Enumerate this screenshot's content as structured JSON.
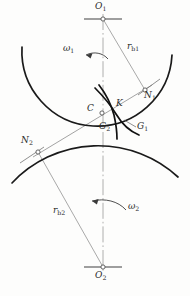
{
  "figure": {
    "colors": {
      "base_curve": "#1a1a1a",
      "involute_curve": "#111111",
      "thin_line": "#8c8c8c",
      "centerline": "#9a9a9a",
      "hatch": "#9e9e9e",
      "label": "#2b2b2b",
      "background": "#fdfdfc"
    }
  },
  "labels": {
    "o1": "O",
    "o1_sub": "1",
    "o2": "O",
    "o2_sub": "2",
    "n1": "N",
    "n1_sub": "1",
    "n2": "N",
    "n2_sub": "2",
    "c": "C",
    "k": "K",
    "g1": "G",
    "g1_sub": "1",
    "g2": "G",
    "g2_sub": "2",
    "rb1": "r",
    "rb1_sub": "b1",
    "rb2": "r",
    "rb2_sub": "b2",
    "omega1": "ω",
    "omega1_sub": "1",
    "omega2": "ω",
    "omega2_sub": "2"
  },
  "points": {
    "o1": {
      "x": 103,
      "y": 19
    },
    "o2": {
      "x": 103,
      "y": 267
    },
    "n1": {
      "x": 145,
      "y": 90
    },
    "n2": {
      "x": 38,
      "y": 152
    },
    "c": {
      "x": 102,
      "y": 113
    },
    "k": {
      "x": 113,
      "y": 104
    }
  },
  "geometry": {
    "base_radius_1": 75,
    "base_radius_2": 118,
    "pressure_angle_deg": 21,
    "line_of_action": "N2 - C - K - N1"
  }
}
